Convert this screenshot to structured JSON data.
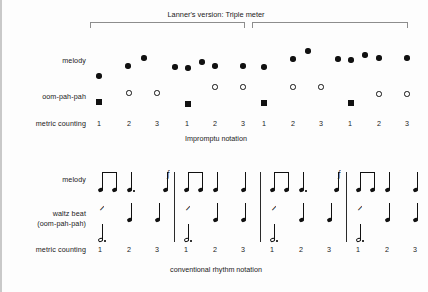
{
  "figure": {
    "title": "Lanner's version: Triple meter",
    "top_caption": "Impromptu notation",
    "bottom_caption": "conventional rhythm notation",
    "colors": {
      "ink": "#111111",
      "bracket": "#8d8d8d",
      "frame": "#c9c9c9",
      "background": "#fdfdfd"
    }
  },
  "top_panel": {
    "labels": {
      "melody": "melody",
      "oom_pah_pah": "oom-pah-pah",
      "metric_counting": "metric counting"
    },
    "brackets": [
      {
        "x1": 88,
        "x2": 243
      },
      {
        "x1": 250,
        "x2": 406
      }
    ],
    "counts": [
      {
        "x": 97,
        "label": "1"
      },
      {
        "x": 127,
        "label": "2"
      },
      {
        "x": 155,
        "label": "3"
      },
      {
        "x": 185,
        "label": "1"
      },
      {
        "x": 213,
        "label": "2"
      },
      {
        "x": 241,
        "label": "3"
      },
      {
        "x": 262,
        "label": "1"
      },
      {
        "x": 291,
        "label": "2"
      },
      {
        "x": 319,
        "label": "3"
      },
      {
        "x": 348,
        "label": "1"
      },
      {
        "x": 377,
        "label": "2"
      },
      {
        "x": 405,
        "label": "3"
      }
    ],
    "melody_dots": [
      {
        "x": 97,
        "y": 76
      },
      {
        "x": 126,
        "y": 66
      },
      {
        "x": 142,
        "y": 58
      },
      {
        "x": 173,
        "y": 67
      },
      {
        "x": 186,
        "y": 68
      },
      {
        "x": 200,
        "y": 62
      },
      {
        "x": 213,
        "y": 66
      },
      {
        "x": 241,
        "y": 66
      },
      {
        "x": 262,
        "y": 67
      },
      {
        "x": 291,
        "y": 59
      },
      {
        "x": 306,
        "y": 51
      },
      {
        "x": 336,
        "y": 59
      },
      {
        "x": 349,
        "y": 60
      },
      {
        "x": 363,
        "y": 55
      },
      {
        "x": 377,
        "y": 58
      },
      {
        "x": 405,
        "y": 58
      }
    ],
    "oom_squares": [
      {
        "x": 97,
        "y": 102
      },
      {
        "x": 186,
        "y": 104
      },
      {
        "x": 262,
        "y": 103
      },
      {
        "x": 349,
        "y": 103
      }
    ],
    "pah_circles": [
      {
        "x": 127,
        "y": 93
      },
      {
        "x": 155,
        "y": 93
      },
      {
        "x": 213,
        "y": 87
      },
      {
        "x": 241,
        "y": 87
      },
      {
        "x": 291,
        "y": 87
      },
      {
        "x": 319,
        "y": 87
      },
      {
        "x": 377,
        "y": 94
      },
      {
        "x": 405,
        "y": 94
      }
    ]
  },
  "bottom_panel": {
    "labels": {
      "melody": "melody",
      "waltz_beat_line1": "waltz beat",
      "waltz_beat_line2": "(oom-pah-pah)",
      "metric_counting": "metric counting"
    },
    "barlines": [
      {
        "x": 172
      },
      {
        "x": 258
      },
      {
        "x": 344
      }
    ],
    "counts": [
      {
        "x": 98,
        "label": "1"
      },
      {
        "x": 127,
        "label": "2"
      },
      {
        "x": 155,
        "label": "3"
      },
      {
        "x": 184,
        "label": "1"
      },
      {
        "x": 213,
        "label": "2"
      },
      {
        "x": 241,
        "label": "3"
      },
      {
        "x": 270,
        "label": "1"
      },
      {
        "x": 299,
        "label": "2"
      },
      {
        "x": 327,
        "label": "3"
      },
      {
        "x": 356,
        "label": "1"
      },
      {
        "x": 385,
        "label": "2"
      },
      {
        "x": 413,
        "label": "3"
      }
    ],
    "melody_notes": [
      {
        "x": 98,
        "type": "eighth-beamed",
        "group": 0,
        "dotted": false
      },
      {
        "x": 112,
        "type": "eighth-beamed",
        "group": 0,
        "dotted": false
      },
      {
        "x": 127,
        "type": "quarter",
        "dotted": true
      },
      {
        "x": 163,
        "type": "eighth-flag",
        "dotted": false
      },
      {
        "x": 184,
        "type": "eighth-beamed",
        "group": 1,
        "dotted": false
      },
      {
        "x": 198,
        "type": "eighth-beamed",
        "group": 1,
        "dotted": false
      },
      {
        "x": 213,
        "type": "quarter",
        "dotted": false
      },
      {
        "x": 241,
        "type": "quarter",
        "dotted": false
      },
      {
        "x": 270,
        "type": "eighth-beamed",
        "group": 2,
        "dotted": false
      },
      {
        "x": 284,
        "type": "eighth-beamed",
        "group": 2,
        "dotted": false
      },
      {
        "x": 299,
        "type": "quarter",
        "dotted": true
      },
      {
        "x": 334,
        "type": "eighth-flag",
        "dotted": false
      },
      {
        "x": 356,
        "type": "eighth-beamed",
        "group": 3,
        "dotted": false
      },
      {
        "x": 370,
        "type": "eighth-beamed",
        "group": 3,
        "dotted": false
      },
      {
        "x": 385,
        "type": "quarter",
        "dotted": false
      },
      {
        "x": 413,
        "type": "quarter",
        "dotted": false
      }
    ],
    "beams": [
      {
        "x1": 98,
        "x2": 112
      },
      {
        "x1": 184,
        "x2": 198
      },
      {
        "x1": 270,
        "x2": 284
      },
      {
        "x1": 356,
        "x2": 370
      }
    ],
    "waltz_rests": [
      {
        "x": 98
      },
      {
        "x": 184
      },
      {
        "x": 270
      },
      {
        "x": 356
      }
    ],
    "waltz_notes": [
      {
        "x": 127
      },
      {
        "x": 155
      },
      {
        "x": 213
      },
      {
        "x": 241
      },
      {
        "x": 299
      },
      {
        "x": 327
      },
      {
        "x": 385
      },
      {
        "x": 413
      }
    ],
    "bass_notes": [
      {
        "x": 98
      },
      {
        "x": 184
      },
      {
        "x": 270
      },
      {
        "x": 356
      }
    ]
  }
}
